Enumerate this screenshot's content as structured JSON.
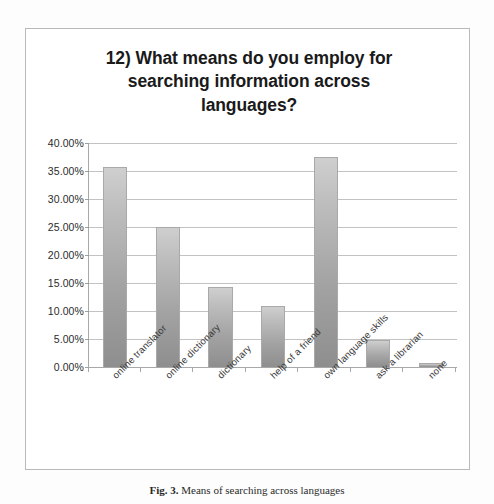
{
  "figure": {
    "caption_label": "Fig. 3.",
    "caption_text": "Means of searching across languages"
  },
  "chart_data": {
    "type": "bar",
    "title": "12) What means do you employ for searching information across languages?",
    "title_lines": [
      "12) What means do you employ for",
      "searching information across",
      "languages?"
    ],
    "categories": [
      "online translator",
      "online dictionary",
      "dictionary",
      "help of a friend",
      "own language skills",
      "ask a librarian",
      "none"
    ],
    "values": [
      35.7,
      25.0,
      14.2,
      10.9,
      37.5,
      4.8,
      0.8
    ],
    "value_labels": [
      "35.70%",
      "25.00%",
      "14.20%",
      "10.90%",
      "37.50%",
      "4.80%",
      "0.80%"
    ],
    "xlabel": "",
    "ylabel": "",
    "ylim": [
      0,
      40
    ],
    "ytick_values": [
      0,
      5,
      10,
      15,
      20,
      25,
      30,
      35,
      40
    ],
    "ytick_labels": [
      "0.00%",
      "5.00%",
      "10.00%",
      "15.00%",
      "20.00%",
      "25.00%",
      "30.00%",
      "35.00%",
      "40.00%"
    ],
    "grid": true,
    "legend": false,
    "legend_position": "none",
    "bar_color_top": "#cfcfcf",
    "bar_color_bottom": "#8e8e8e",
    "bar_border_color": "#a9a9a9",
    "gridline_color": "#c2c2c2",
    "axis_color": "#a8a8a8",
    "label_rotation_deg": -45
  }
}
